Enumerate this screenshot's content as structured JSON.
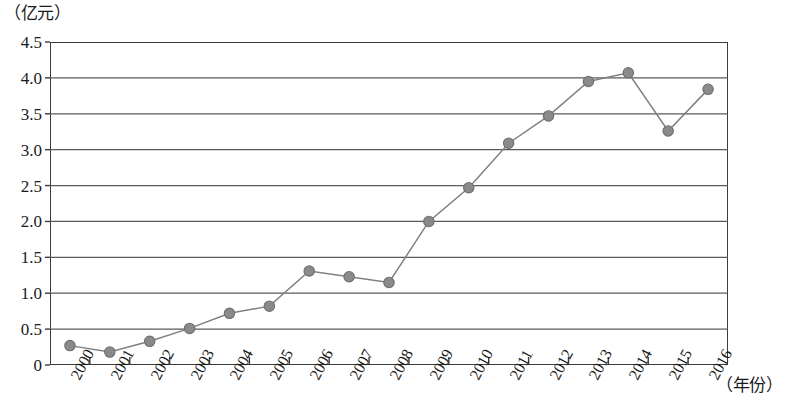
{
  "chart_data": {
    "type": "line",
    "title": "",
    "subtitle": "",
    "xlabel": "（年份）",
    "ylabel": "（亿元）",
    "categories": [
      "2000",
      "2001",
      "2002",
      "2003",
      "2004",
      "2005",
      "2006",
      "2007",
      "2008",
      "2009",
      "2010",
      "2011",
      "2012",
      "2013",
      "2014",
      "2015",
      "2016"
    ],
    "values": [
      0.27,
      0.18,
      0.33,
      0.51,
      0.72,
      0.82,
      1.31,
      1.23,
      1.15,
      2.0,
      2.47,
      3.09,
      3.47,
      3.95,
      4.07,
      3.26,
      3.84
    ],
    "series": [
      {
        "name": "",
        "values": [
          0.27,
          0.18,
          0.33,
          0.51,
          0.72,
          0.82,
          1.31,
          1.23,
          1.15,
          2.0,
          2.47,
          3.09,
          3.47,
          3.95,
          4.07,
          3.26,
          3.84
        ]
      }
    ],
    "ylim": [
      0,
      4.5
    ],
    "ytick_labels": [
      "0",
      "0.5",
      "1.0",
      "1.5",
      "2.0",
      "2.5",
      "3.0",
      "3.5",
      "4.0",
      "4.5"
    ],
    "ytick_values": [
      0,
      0.5,
      1.0,
      1.5,
      2.0,
      2.5,
      3.0,
      3.5,
      4.0,
      4.5
    ],
    "grid": "horizontal",
    "legend": "none",
    "marker": "circle",
    "colors": {
      "line": "#808080",
      "marker_fill": "#8a8a8a",
      "marker_stroke": "#6e6e6e",
      "grid": "#5a5a5a",
      "axis": "#3b3b3b",
      "text": "#1a1a1a",
      "background": "#ffffff"
    }
  }
}
